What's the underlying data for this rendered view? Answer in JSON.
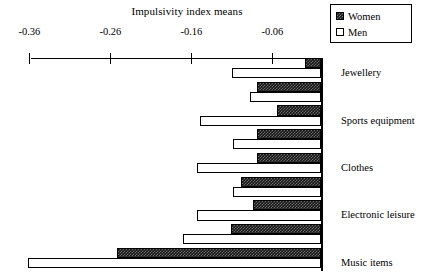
{
  "chart": {
    "title": "Impulsivity index means",
    "legend": {
      "position": "top-right",
      "entries": [
        {
          "label": "Women",
          "swatch": "dark-hatched-square"
        },
        {
          "label": "Men",
          "swatch": "white-square"
        }
      ]
    }
  },
  "chart_data": {
    "type": "bar",
    "orientation": "horizontal",
    "title": "Impulsivity index means",
    "xlabel": "",
    "ylabel": "",
    "xlim": [
      -0.4,
      0.0
    ],
    "grid": false,
    "legend_position": "top-right",
    "xticks": [
      -0.36,
      -0.26,
      -0.16,
      -0.06
    ],
    "xticklabels": [
      "-0.36",
      "-0.26",
      "-0.16",
      "-0.06"
    ],
    "categories": [
      "Jewellery",
      "Sports equipment",
      "Clothes",
      "Electronic leisure",
      "Music items",
      "Books",
      "Kitchen items",
      "Footwear",
      "Body"
    ],
    "series": [
      {
        "name": "Women",
        "color": "#171717",
        "values": [
          -0.02,
          -0.079,
          -0.054,
          -0.079,
          -0.079,
          -0.099,
          -0.084,
          -0.111,
          -0.252
        ]
      },
      {
        "name": "Men",
        "color": "#ffffff",
        "values": [
          -0.11,
          -0.088,
          -0.149,
          -0.109,
          -0.153,
          -0.109,
          -0.153,
          -0.17,
          -0.362
        ]
      }
    ]
  }
}
